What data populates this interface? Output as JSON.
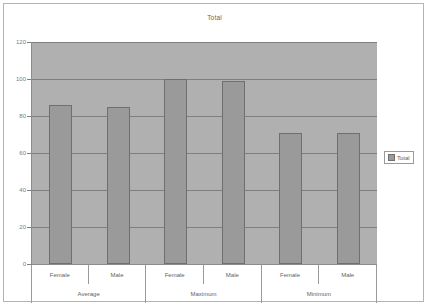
{
  "chart_data": {
    "type": "bar",
    "title": "Total",
    "xlabel": "",
    "ylabel": "",
    "ylim": [
      0,
      120
    ],
    "yticks": [
      0,
      20,
      40,
      60,
      80,
      100,
      120
    ],
    "grid": true,
    "legend": {
      "position": "right",
      "entries": [
        {
          "label": "Total",
          "color": "#9a9a9a",
          "marker": "square-swatch-icon"
        }
      ]
    },
    "groups": [
      "Average",
      "Maximum",
      "Minimum"
    ],
    "categories": [
      "Female",
      "Male",
      "Female",
      "Male",
      "Female",
      "Male"
    ],
    "series": [
      {
        "name": "Total",
        "color": "#9a9a9a",
        "values": [
          86,
          85,
          100,
          99,
          71,
          71
        ]
      }
    ],
    "points": [
      {
        "group": "Average",
        "category": "Female",
        "value": 86
      },
      {
        "group": "Average",
        "category": "Male",
        "value": 85
      },
      {
        "group": "Maximum",
        "category": "Female",
        "value": 100
      },
      {
        "group": "Maximum",
        "category": "Male",
        "value": 99
      },
      {
        "group": "Minimum",
        "category": "Female",
        "value": 71
      },
      {
        "group": "Minimum",
        "category": "Male",
        "value": 71
      }
    ]
  },
  "colors": {
    "plot_background": "#b0b0b0",
    "bar_fill": "#9a9a9a",
    "bar_border": "#6f6f6f",
    "gridline": "#7f7f7f",
    "frame_border": "#b4b4b4",
    "text": "#5f5f5f",
    "page_background": "#ffffff"
  },
  "labels": {
    "ytick_0": "0",
    "ytick_20": "20",
    "ytick_40": "40",
    "ytick_60": "60",
    "ytick_80": "80",
    "ytick_100": "100",
    "ytick_120": "120"
  }
}
